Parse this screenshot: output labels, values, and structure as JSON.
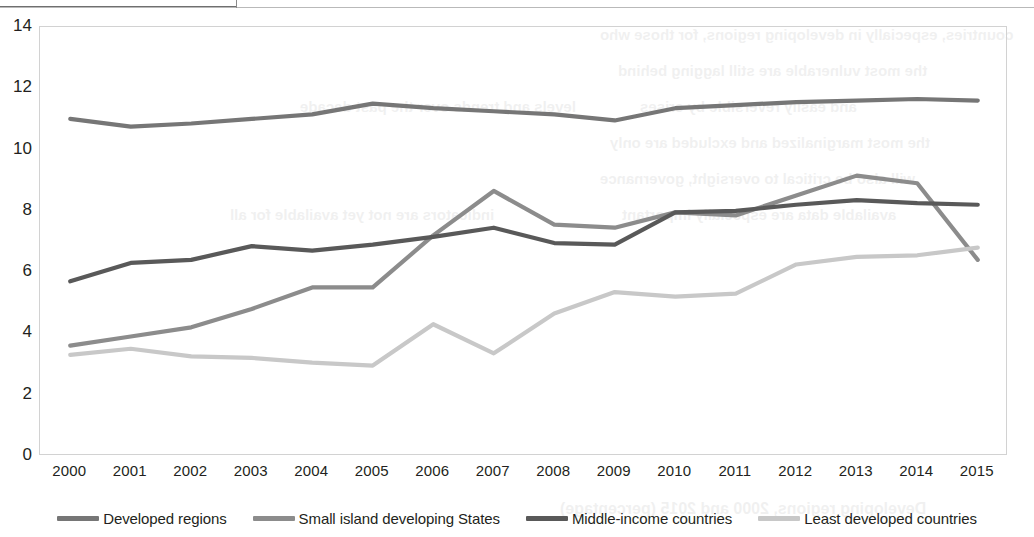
{
  "page": {
    "top_crumb": "",
    "background_color": "#ffffff"
  },
  "bleed_text": {
    "b1": "countries, especially in developing regions, for those who",
    "b2": "the most vulnerable are still lagging behind",
    "b3": "and easily reversible by crises",
    "b4": "the most marginalized and excluded are only",
    "b5": "will also be critical to oversight, governance",
    "b6": "available data are especially important",
    "b7": "levels and trends over the past decade",
    "b8": "indicators are not yet available for all",
    "b9": "Developing regions, 2000 and 2015 (percentage)"
  },
  "chart_data": {
    "type": "line",
    "title": "",
    "xlabel": "",
    "ylabel": "",
    "x": [
      2000,
      2001,
      2002,
      2003,
      2004,
      2005,
      2006,
      2007,
      2008,
      2009,
      2010,
      2011,
      2012,
      2013,
      2014,
      2015
    ],
    "xtick_labels": [
      "2000",
      "2001",
      "2002",
      "2003",
      "2004",
      "2005",
      "2006",
      "2007",
      "2008",
      "2009",
      "2010",
      "2011",
      "2012",
      "2013",
      "2014",
      "2015"
    ],
    "ylim": [
      0,
      14
    ],
    "ytick_values": [
      0,
      2,
      4,
      6,
      8,
      10,
      12,
      14
    ],
    "ytick_labels": [
      "0",
      "2",
      "4",
      "6",
      "8",
      "10",
      "12",
      "14"
    ],
    "grid": false,
    "legend_position": "bottom",
    "series": [
      {
        "name": "Developed regions",
        "color": "#767676",
        "values": [
          11.0,
          10.75,
          10.85,
          11.0,
          11.15,
          11.5,
          11.35,
          11.25,
          11.15,
          10.95,
          11.35,
          11.45,
          11.55,
          11.6,
          11.65,
          11.6
        ]
      },
      {
        "name": "Small island developing States",
        "color": "#8c8c8c",
        "values": [
          3.6,
          3.9,
          4.2,
          4.8,
          5.5,
          5.5,
          7.2,
          8.65,
          7.55,
          7.45,
          7.95,
          7.85,
          8.5,
          9.15,
          8.9,
          6.4
        ]
      },
      {
        "name": "Middle-income countries",
        "color": "#595959",
        "values": [
          5.7,
          6.3,
          6.4,
          6.85,
          6.7,
          6.9,
          7.15,
          7.45,
          6.95,
          6.9,
          7.95,
          8.0,
          8.2,
          8.35,
          8.25,
          8.2
        ]
      },
      {
        "name": "Least developed countries",
        "color": "#c8c8c8",
        "values": [
          3.3,
          3.5,
          3.25,
          3.2,
          3.05,
          2.95,
          4.3,
          3.35,
          4.65,
          5.35,
          5.2,
          5.3,
          6.25,
          6.5,
          6.55,
          6.8
        ]
      }
    ]
  }
}
